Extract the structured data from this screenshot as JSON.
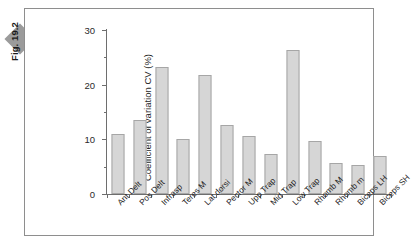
{
  "figure": {
    "tag_label": "Fig. 19.2",
    "marker_icon": "diamond-icon",
    "marker_color": "#9b9b9b"
  },
  "style": {
    "bar_fill": "#d6d6d6",
    "bar_border": "#a6a6a6",
    "axis_color": "#6e6e6e",
    "frame_color": "#8e8e8e",
    "background": "#ffffff"
  },
  "chart_data": {
    "type": "bar",
    "title": "",
    "xlabel": "",
    "ylabel": "Coefficient of variation CV (%)",
    "ylim": [
      0,
      30
    ],
    "yticks": [
      0,
      10,
      20,
      30
    ],
    "yminorticks": [
      5,
      15,
      25
    ],
    "grid": false,
    "legend": false,
    "categories": [
      "Ant Delt",
      "Pos Delt",
      "Infrasp",
      "Teres M",
      "Lat dorsi",
      "Pector M",
      "Upp Trap",
      "Mid Trap",
      "Low Trap",
      "Rhomb M",
      "Rhomb m",
      "Biceps LH",
      "Biceps SH"
    ],
    "values": [
      11.0,
      13.6,
      23.2,
      10.0,
      21.8,
      12.7,
      10.6,
      7.3,
      26.3,
      9.7,
      5.7,
      5.3,
      7.0
    ]
  }
}
